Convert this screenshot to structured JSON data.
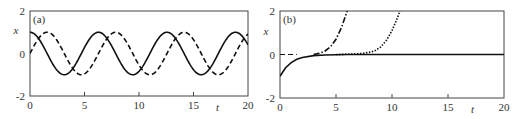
{
  "chart_data": [
    {
      "type": "line",
      "panel_label": "(a)",
      "xlabel": "t",
      "ylabel": "x",
      "xlim": [
        0,
        20
      ],
      "ylim": [
        -2,
        2
      ],
      "x_ticks": [
        "0",
        "5",
        "10",
        "15",
        "20"
      ],
      "y_ticks": [
        "-2",
        "0",
        "2"
      ],
      "grid": false,
      "legend": null,
      "series": [
        {
          "name": "solid",
          "style": "solid",
          "formula": "cos(t)",
          "x": [
            0,
            1.57,
            3.14,
            4.71,
            6.28,
            7.85,
            9.42,
            11.0,
            12.57,
            14.14,
            15.71,
            17.28,
            18.85,
            20
          ],
          "y": [
            1,
            0,
            -1,
            0,
            1,
            0,
            -1,
            0,
            1,
            0,
            -1,
            0,
            1,
            0.41
          ]
        },
        {
          "name": "dashed",
          "style": "dashed",
          "formula": "sin(t)",
          "x": [
            0,
            1.57,
            3.14,
            4.71,
            6.28,
            7.85,
            9.42,
            11.0,
            12.57,
            14.14,
            15.71,
            17.28,
            18.85,
            20
          ],
          "y": [
            0,
            1,
            0,
            -1,
            0,
            1,
            0,
            -1,
            0,
            1,
            0,
            -1,
            0,
            0.91
          ]
        }
      ]
    },
    {
      "type": "line",
      "panel_label": "(b)",
      "xlabel": "t",
      "ylabel": "x",
      "xlim": [
        0,
        20
      ],
      "ylim": [
        -2,
        2
      ],
      "x_ticks": [
        "0",
        "5",
        "10",
        "15",
        "20"
      ],
      "y_ticks": [
        "-2",
        "0",
        "2"
      ],
      "grid": false,
      "legend": null,
      "series": [
        {
          "name": "solid",
          "style": "solid",
          "x": [
            0,
            0.5,
            1,
            1.5,
            2,
            3,
            4,
            6,
            10,
            15,
            20
          ],
          "y": [
            -1,
            -0.61,
            -0.37,
            -0.22,
            -0.14,
            -0.05,
            -0.02,
            0,
            0,
            0,
            0
          ]
        },
        {
          "name": "dash-dot",
          "style": "dashdot",
          "x": [
            3,
            3.5,
            4,
            4.5,
            5,
            5.5,
            6
          ],
          "y": [
            0,
            0.05,
            0.15,
            0.35,
            0.7,
            1.25,
            2
          ]
        },
        {
          "name": "dotted",
          "style": "dotted",
          "x": [
            5,
            6,
            7,
            8,
            8.5,
            9,
            9.5,
            10,
            10.5,
            10.7
          ],
          "y": [
            0,
            0.01,
            0.03,
            0.1,
            0.18,
            0.35,
            0.65,
            1.1,
            1.7,
            2
          ]
        },
        {
          "name": "dashed-zero",
          "style": "dashed",
          "x": [
            0,
            1.5
          ],
          "y": [
            0,
            0
          ]
        }
      ]
    }
  ]
}
